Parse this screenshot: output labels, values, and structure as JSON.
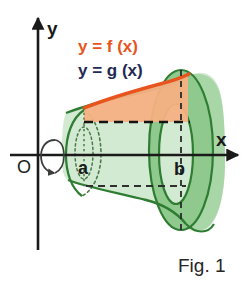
{
  "figure": {
    "caption": "Fig. 1",
    "axes": {
      "x_label": "x",
      "y_label": "y",
      "origin_label": "O"
    },
    "bounds": {
      "lower_label": "a",
      "upper_label": "b"
    },
    "equations": {
      "upper_curve": "y = f (x)",
      "lower_curve": "y = g (x)"
    },
    "icons": {
      "rotation_arrow": "rotation-arrow-icon",
      "x_axis_arrow": "x-axis-arrowhead-icon",
      "y_axis_arrow": "y-axis-arrowhead-icon"
    },
    "colors": {
      "curve_f": "#e8541e",
      "curve_g": "#1f2a52",
      "region_fill": "#f6b183",
      "solid_light": "#d2e9d2",
      "solid_mid": "#b4dcb2",
      "solid_dark": "#8fc98d",
      "outline_green": "#2e7d32",
      "axis_black": "#1a1a1a",
      "background": "#ffffff"
    }
  }
}
